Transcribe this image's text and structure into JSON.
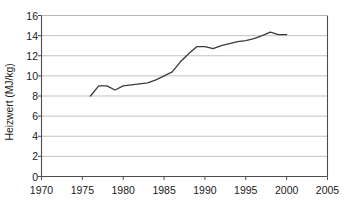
{
  "chart_data": {
    "type": "line",
    "title": "",
    "subtitle": "",
    "xlabel": "",
    "ylabel": "Heizwert (MJ/kg)",
    "xlim": [
      1970,
      2005
    ],
    "ylim": [
      0,
      16
    ],
    "xticks": [
      1970,
      1975,
      1980,
      1985,
      1990,
      1995,
      2000,
      2005
    ],
    "xtick_labels": [
      "1970",
      "1975",
      "1980",
      "1985",
      "1990",
      "1995",
      "2000",
      "2005"
    ],
    "yticks": [
      0,
      2,
      4,
      6,
      8,
      10,
      12,
      14,
      16
    ],
    "ytick_labels": [
      "0",
      "2",
      "4",
      "6",
      "8",
      "10",
      "12",
      "14",
      "16"
    ],
    "grid": "horizontal",
    "grid_color": "#b3b3b3",
    "legend": "none",
    "line_color": "#3a3a3a",
    "line_width": 1.3,
    "axis_color": "#4d4d4d",
    "background": "#ffffff",
    "series": [
      {
        "name": "Heizwert",
        "x": [
          1976,
          1977,
          1978,
          1979,
          1980,
          1981,
          1982,
          1983,
          1984,
          1985,
          1986,
          1987,
          1988,
          1989,
          1990,
          1991,
          1992,
          1993,
          1994,
          1995,
          1996,
          1997,
          1998,
          1999,
          2000
        ],
        "values": [
          8.0,
          9.0,
          9.0,
          8.6,
          9.0,
          9.1,
          9.2,
          9.3,
          9.6,
          10.0,
          10.4,
          11.4,
          12.2,
          12.9,
          12.9,
          12.7,
          13.0,
          13.2,
          13.4,
          13.5,
          13.7,
          14.0,
          14.35,
          14.1,
          14.1
        ]
      }
    ]
  }
}
